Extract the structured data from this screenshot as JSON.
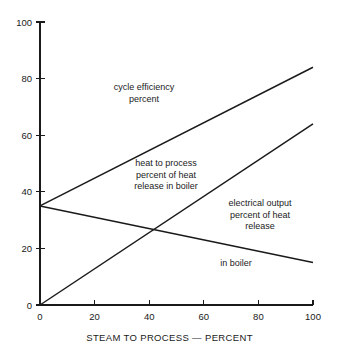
{
  "chart_data": {
    "type": "line",
    "title": "",
    "xlabel": "STEAM TO PROCESS — PERCENT",
    "ylabel": "",
    "xlim": [
      0,
      100
    ],
    "ylim": [
      0,
      100
    ],
    "xticks": [
      0,
      20,
      40,
      60,
      80,
      100
    ],
    "yticks": [
      0,
      20,
      40,
      60,
      80,
      100
    ],
    "xtick_labels": [
      "0",
      "20",
      "40",
      "60",
      "80",
      "100"
    ],
    "ytick_labels": [
      "0",
      "20",
      "40",
      "60",
      "80",
      "100"
    ],
    "grid": false,
    "legend": "none",
    "x": [
      0,
      100
    ],
    "series": [
      {
        "name": "cycle efficiency percent",
        "values": [
          35,
          84
        ],
        "x": [
          0,
          100
        ]
      },
      {
        "name": "heat to process percent of heat release in boiler",
        "values": [
          0,
          64
        ],
        "x": [
          0,
          100
        ]
      },
      {
        "name": "electrical output percent of heat release in boiler",
        "values": [
          35,
          15
        ],
        "x": [
          0,
          100
        ]
      }
    ],
    "annotations": [
      {
        "id": "cycle-efficiency",
        "lines": [
          "cycle efficiency",
          "percent"
        ],
        "text": "cycle efficiency\npercent"
      },
      {
        "id": "heat-to-process",
        "lines": [
          "heat to process",
          "percent of heat",
          "release in boiler"
        ],
        "text": "heat to process\npercent of heat\nrelease in boiler"
      },
      {
        "id": "electrical-output",
        "lines": [
          "electrical output",
          "percent of heat",
          "release"
        ],
        "text": "electrical output\npercent of heat\nrelease"
      },
      {
        "id": "in-boiler",
        "lines": [
          "in boiler"
        ],
        "text": "in boiler"
      }
    ],
    "colors": {
      "line": "#1a1a1a",
      "axis": "#1a1a1a",
      "background": "#ffffff",
      "text": "#1a1a1a"
    }
  }
}
